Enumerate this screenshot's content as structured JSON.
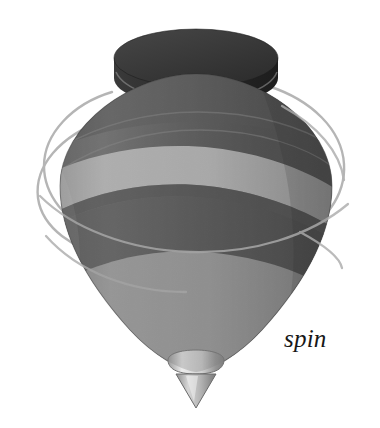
{
  "figure": {
    "background_color": "#ffffff",
    "width": 380,
    "height": 428,
    "caption": {
      "text": "spin",
      "style": "italic-serif",
      "color": "#171717",
      "x": 284,
      "y": 326
    },
    "object": {
      "name": "spinning top",
      "parts": [
        {
          "name": "knob",
          "description": "dark cylindrical disc on top",
          "color_top": "#3d3d3d",
          "color_side": "#2a2a2a",
          "cx": 196,
          "cy": 58,
          "rx": 82,
          "ry": 30,
          "height": 34
        },
        {
          "name": "shoulder",
          "description": "upper dome of the bulb",
          "color": "#4c4c4c"
        },
        {
          "name": "light-stripe-upper",
          "description": "light gray band across the widest part",
          "color": "#b9b9b9"
        },
        {
          "name": "dark-stripe-lower",
          "description": "dark band below the light stripe",
          "color": "#4a4a4a"
        },
        {
          "name": "lower-cone",
          "description": "medium gray tapering cone",
          "color": "#909090"
        },
        {
          "name": "collar",
          "description": "light colored ring above the tip",
          "color": "#d8d8d8"
        },
        {
          "name": "tip",
          "description": "conical metal point",
          "color": "#b0b0b0"
        },
        {
          "name": "motion-arcs",
          "description": "thin gray swirl lines indicating rotation",
          "color": "#a9a9a9",
          "count": 6
        }
      ],
      "palette": {
        "knob_dark": "#2a2a2a",
        "knob_top": "#3d3d3d",
        "body_dark": "#4a4a4a",
        "body_mid": "#6f6f6f",
        "stripe_light": "#b9b9b9",
        "cone_gray": "#909090",
        "collar_light": "#d8d8d8",
        "tip_gray": "#b0b0b0",
        "arc_gray": "#a9a9a9"
      }
    }
  }
}
